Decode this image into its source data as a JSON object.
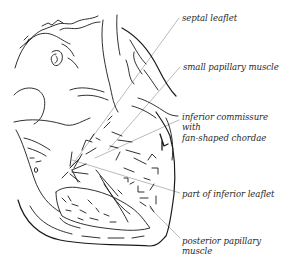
{
  "figure": {
    "type": "anatomical line drawing",
    "stroke_color": "#1a1a1a",
    "leader_color": "#a8a8a8",
    "background": "#ffffff"
  },
  "labels": [
    {
      "id": "septal-leaflet",
      "lines": [
        "septal leaflet"
      ],
      "x": 182,
      "y": 13
    },
    {
      "id": "small-papillary-muscle",
      "lines": [
        "small papillary muscle"
      ],
      "x": 183,
      "y": 62
    },
    {
      "id": "inferior-commissure",
      "lines": [
        "inferior commissure",
        "with",
        "fan-shaped chordae"
      ],
      "x": 182,
      "y": 112
    },
    {
      "id": "part-of-inferior-leaflet",
      "lines": [
        "part of inferior leaflet"
      ],
      "x": 182,
      "y": 189
    },
    {
      "id": "posterior-papillary-muscle",
      "lines": [
        "posterior papillary",
        "muscle"
      ],
      "x": 182,
      "y": 236
    }
  ]
}
